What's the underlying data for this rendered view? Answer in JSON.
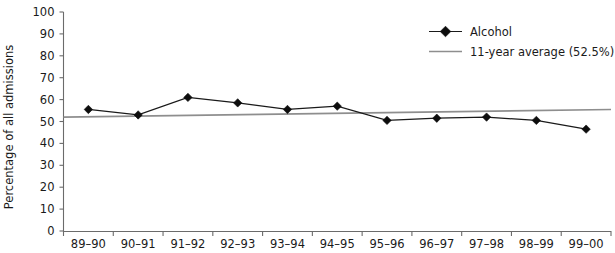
{
  "chart_data": {
    "type": "line",
    "title": "",
    "xlabel": "",
    "ylabel": "Percentage of all admissions",
    "ylim": [
      0,
      100
    ],
    "ytick_step": 10,
    "yticks": [
      "0",
      "10",
      "20",
      "30",
      "40",
      "50",
      "60",
      "70",
      "80",
      "90",
      "100"
    ],
    "grid": false,
    "legend_position": "top-right",
    "categories": [
      "89–90",
      "90–91",
      "91–92",
      "92–93",
      "93–94",
      "94–95",
      "95–96",
      "96–97",
      "97–98",
      "98–99",
      "99–00"
    ],
    "series": [
      {
        "name": "Alcohol",
        "marker": "diamond",
        "color": "#0d0d0d",
        "values": [
          55.5,
          53.0,
          61.0,
          58.5,
          55.5,
          57.0,
          50.5,
          51.5,
          52.0,
          50.5,
          46.5
        ]
      },
      {
        "name": "11-year average (52.5%)",
        "marker": "none",
        "color": "#8e8e8e",
        "values": [
          52.0,
          52.4,
          52.7,
          53.1,
          53.4,
          53.8,
          54.1,
          54.5,
          54.8,
          55.2,
          55.5
        ]
      }
    ],
    "annotations": []
  },
  "legend": {
    "items": [
      {
        "label": "Alcohol",
        "swatch": "line-with-diamond-marker",
        "color": "#0d0d0d"
      },
      {
        "label": "11-year average (52.5%)",
        "swatch": "plain-line",
        "color": "#8e8e8e"
      }
    ]
  },
  "axes": {
    "y_title": "Percentage of all admissions"
  }
}
